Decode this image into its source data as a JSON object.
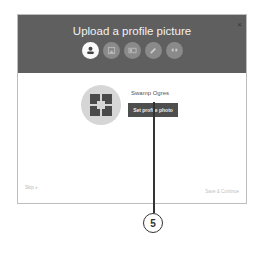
{
  "dialog": {
    "title": "Upload a profile picture",
    "close_label": "×",
    "steps": [
      {
        "icon": "profile-picture-icon",
        "active": true
      },
      {
        "icon": "cover-photo-icon",
        "active": false
      },
      {
        "icon": "profile-card-icon",
        "active": false
      },
      {
        "icon": "pencil-icon",
        "active": false
      },
      {
        "icon": "quote-icon",
        "active": false
      }
    ],
    "user_name": "Swamp Ogres",
    "set_photo_label": "Set profile photo",
    "skip_label": "Skip »",
    "save_label": "Save & Continue"
  },
  "callout": {
    "number": "5"
  },
  "colors": {
    "header": "#5f5f5f",
    "button": "#4e4e4e",
    "step_inactive": "#8a8a8a"
  }
}
